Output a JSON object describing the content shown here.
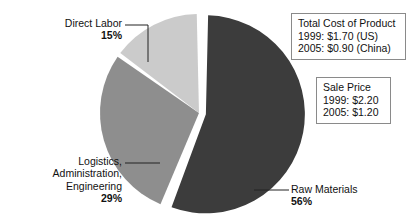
{
  "chart_data": {
    "type": "pie",
    "title": "",
    "categories": [
      "Raw Materials",
      "Logistics, Administration, Engineering",
      "Direct Labor"
    ],
    "values": [
      56,
      29,
      15
    ],
    "value_unit": "%",
    "legend": "none",
    "exploded_slice": "Raw Materials",
    "slice_colors": [
      "#3c3c3c",
      "#8e8e8e",
      "#cbcbcb"
    ],
    "gap_color": "#ffffff",
    "slices": [
      {
        "name": "Raw Materials",
        "label": "Raw Materials",
        "percent_label": "56%",
        "value": 56,
        "color": "#3c3c3c",
        "exploded": true,
        "label_position": "right"
      },
      {
        "name": "Logistics, Administration, Engineering",
        "label_lines": [
          "Logistics,",
          "Administration,",
          "Engineering"
        ],
        "percent_label": "29%",
        "value": 29,
        "color": "#8e8e8e",
        "exploded": false,
        "label_position": "bottom-left"
      },
      {
        "name": "Direct Labor",
        "label": "Direct Labor",
        "percent_label": "15%",
        "value": 15,
        "color": "#cbcbcb",
        "exploded": false,
        "label_position": "top-left"
      }
    ]
  },
  "labels": {
    "direct_labor": {
      "name": "Direct Labor",
      "percent": "15%"
    },
    "logistics": {
      "line1": "Logistics,",
      "line2": "Administration,",
      "line3": "Engineering",
      "percent": "29%"
    },
    "raw_materials": {
      "name": "Raw Materials",
      "percent": "56%"
    }
  },
  "annotations": {
    "total_cost_box": {
      "title": "Total Cost of Product",
      "line_1999": "1999: $1.70 (US)",
      "line_2005": "2005: $0.90 (China)"
    },
    "sale_price_box": {
      "title": "Sale Price",
      "line_1999": "1999: $2.20",
      "line_2005": "2005: $1.20"
    }
  }
}
